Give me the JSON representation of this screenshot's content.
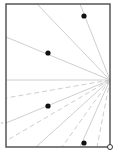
{
  "diagram": {
    "width": 115,
    "height": 160,
    "frame": {
      "x1": 6,
      "y1": 4,
      "x2": 110,
      "y2": 147,
      "color": "#555555",
      "stroke": 1.5
    },
    "focal": {
      "x": 110,
      "y": 80
    },
    "ray_color": "#c8c8c8",
    "rays": [
      {
        "x": 37,
        "y": 4,
        "dashed": false
      },
      {
        "x": 80,
        "y": 4,
        "dashed": false
      },
      {
        "x": 6,
        "y": 37,
        "dashed": false
      },
      {
        "x": 6,
        "y": 80,
        "dashed": false
      },
      {
        "x": 6,
        "y": 98,
        "dashed": true
      },
      {
        "x": 6,
        "y": 123,
        "dashed": false
      },
      {
        "x": 6,
        "y": 141,
        "dashed": true
      },
      {
        "x": 36,
        "y": 147,
        "dashed": false
      },
      {
        "x": 62,
        "y": 147,
        "dashed": true
      },
      {
        "x": 80,
        "y": 147,
        "dashed": false
      },
      {
        "x": 97,
        "y": 147,
        "dashed": true
      }
    ],
    "points": [
      {
        "x": 84,
        "y": 16
      },
      {
        "x": 48,
        "y": 53
      },
      {
        "x": 48,
        "y": 106
      },
      {
        "x": 84,
        "y": 143
      }
    ],
    "point_color": "#111111",
    "open_marker": {
      "x": 110,
      "y": 147,
      "r": 2.5
    },
    "side_tick": {
      "x": 2,
      "y": 123
    }
  }
}
